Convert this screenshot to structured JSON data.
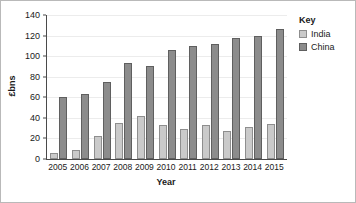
{
  "chart_data": {
    "type": "bar",
    "title": "",
    "xlabel": "Year",
    "ylabel": "£bns",
    "categories": [
      "2005",
      "2006",
      "2007",
      "2008",
      "2009",
      "2010",
      "2011",
      "2012",
      "2013",
      "2014",
      "2015"
    ],
    "series": [
      {
        "name": "India",
        "color": "#cacaca",
        "values": [
          6,
          9,
          22,
          35,
          42,
          33.5,
          29.5,
          33.5,
          27,
          31.5,
          34.5
        ]
      },
      {
        "name": "China",
        "color": "#8c8c8c",
        "values": [
          60,
          63,
          75,
          93,
          90.5,
          106,
          110,
          112,
          118,
          120,
          126.5
        ]
      }
    ],
    "ylim": [
      0,
      140
    ],
    "yticks": [
      0,
      20,
      40,
      60,
      80,
      100,
      120,
      140
    ],
    "ytick_labels": [
      "0",
      "20",
      "40",
      "60",
      "80",
      "100",
      "120",
      "140"
    ],
    "grid": true,
    "legend_position": "right",
    "legend_title": "Key"
  }
}
